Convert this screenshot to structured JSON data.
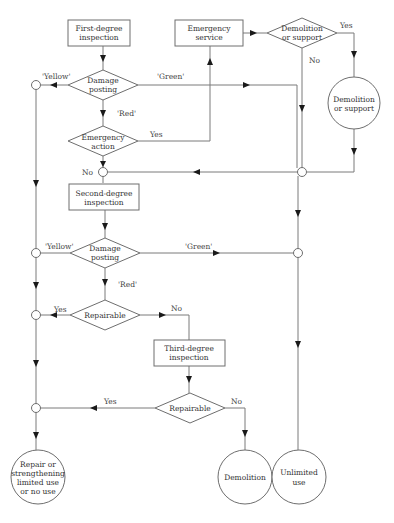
{
  "diagram": {
    "type": "flowchart",
    "nodes": {
      "first_degree": [
        "First-degree",
        "inspection"
      ],
      "emergency_service": [
        "Emergency",
        "service"
      ],
      "demolition_or_support_decision": [
        "Demolition",
        "or support"
      ],
      "damage_posting_1": [
        "Damage",
        "posting"
      ],
      "emergency_action": [
        "Emergency",
        "action"
      ],
      "demolition_or_support_end": [
        "Demolition",
        "or support"
      ],
      "second_degree": [
        "Second-degree",
        "inspection"
      ],
      "damage_posting_2": [
        "Damage",
        "posting"
      ],
      "repairable_1": "Repairable",
      "third_degree": [
        "Third-degree",
        "inspection"
      ],
      "repairable_2": "Repairable",
      "repair_end": [
        "Repair or",
        "strengthening",
        "limited use",
        "or no use"
      ],
      "demolition_end": "Demolition",
      "unlimited_end": [
        "Unlimited",
        "use"
      ]
    },
    "edge_labels": {
      "yellow_1": "'Yellow'",
      "green_1": "'Green'",
      "red_1": "'Red'",
      "yes_emergency": "Yes",
      "no_emergency": "No",
      "yes_demolition": "Yes",
      "no_demolition": "No",
      "yellow_2": "'Yellow'",
      "green_2": "'Green'",
      "red_2": "'Red'",
      "yes_repair_1": "Yes",
      "no_repair_1": "No",
      "yes_repair_2": "Yes",
      "no_repair_2": "No"
    }
  }
}
